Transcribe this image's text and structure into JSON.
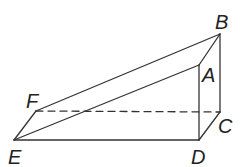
{
  "figure": {
    "type": "triangular-prism",
    "stroke_color": "#333333",
    "vertices": {
      "A": [
        199,
        65
      ],
      "B": [
        220,
        34
      ],
      "C": [
        220,
        112
      ],
      "D": [
        199,
        140
      ],
      "E": [
        14,
        140
      ],
      "F": [
        36,
        111
      ]
    },
    "labels": {
      "A": "A",
      "B": "B",
      "C": "C",
      "D": "D",
      "E": "E",
      "F": "F"
    },
    "solid_edges": [
      "EA",
      "AB",
      "FB",
      "EF",
      "ED",
      "AD",
      "BC",
      "DC"
    ],
    "dashed_edges": [
      "FC"
    ]
  }
}
